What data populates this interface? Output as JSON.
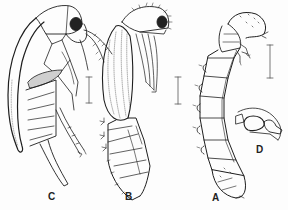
{
  "figure": {
    "labels": {
      "c": "C",
      "b": "B",
      "a": "A",
      "d": "D"
    },
    "panels": [
      {
        "id": "C",
        "depicts": "adult beetle, lateral view"
      },
      {
        "id": "B",
        "depicts": "pupa, lateral view"
      },
      {
        "id": "A",
        "depicts": "larva, lateral view"
      },
      {
        "id": "D",
        "depicts": "detail of structure"
      }
    ],
    "scale_bars": 3,
    "colors": {
      "ink": "#1e1e1e",
      "background": "#fdfdfd"
    }
  }
}
